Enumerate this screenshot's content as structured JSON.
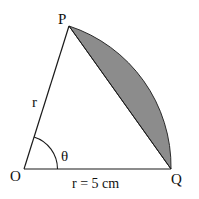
{
  "figure": {
    "type": "circular-sector-segment",
    "points": {
      "center": "O",
      "arc_start": "P",
      "arc_end": "Q"
    },
    "labels": {
      "P": "P",
      "O": "O",
      "Q": "Q",
      "side_op": "r",
      "angle": "θ",
      "side_oq": "r = 5 cm"
    },
    "given": {
      "radius": 5,
      "radius_unit": "cm"
    },
    "shaded_region": "minor segment between chord PQ and arc PQ",
    "colors": {
      "line": "#1a1a1a",
      "shade": "#8c8c8c",
      "background": "#ffffff"
    }
  }
}
